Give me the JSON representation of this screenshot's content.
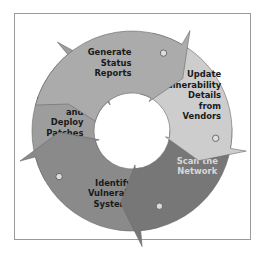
{
  "diagram": {
    "type": "cycle",
    "direction": "clockwise",
    "stages": [
      {
        "id": "generate",
        "lines": [
          "Generate",
          "Status",
          "Reports"
        ],
        "fill": "#ababab",
        "text_color": "#1a1a1a"
      },
      {
        "id": "update",
        "lines": [
          "Update",
          "Vulnerability",
          "Details",
          "from",
          "Vendors"
        ],
        "fill": "#cdcdcd",
        "text_color": "#1a1a1a"
      },
      {
        "id": "scan",
        "lines": [
          "Scan the",
          "Network"
        ],
        "fill": "#777777",
        "text_color": "#d8d8d8"
      },
      {
        "id": "identify",
        "lines": [
          "Identify",
          "Vulnerable",
          "Systems"
        ],
        "fill": "#8a8a8a",
        "text_color": "#1a1a1a"
      },
      {
        "id": "download",
        "lines": [
          "Download",
          "and",
          "Deploy",
          "Patches"
        ],
        "fill": "#9d9d9d",
        "text_color": "#1a1a1a"
      }
    ],
    "frame_color": "#9a9a9a",
    "dot_fill": "#dddddd",
    "dot_stroke": "#555555"
  }
}
